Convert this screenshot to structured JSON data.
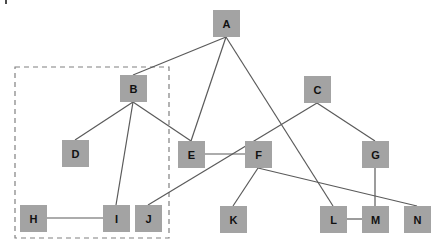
{
  "diagram": {
    "type": "graph",
    "colors": {
      "node_fill": "#a3a3a3",
      "node_text": "#111111",
      "edge": "#5a5a5a",
      "group_border": "#808080",
      "background": "#ffffff"
    },
    "nodes": [
      {
        "id": "A",
        "label": "A",
        "x": 213,
        "y": 10,
        "w": 27,
        "h": 27
      },
      {
        "id": "B",
        "label": "B",
        "x": 120,
        "y": 75,
        "w": 27,
        "h": 27
      },
      {
        "id": "C",
        "label": "C",
        "x": 304,
        "y": 76,
        "w": 27,
        "h": 27
      },
      {
        "id": "D",
        "label": "D",
        "x": 62,
        "y": 140,
        "w": 27,
        "h": 27
      },
      {
        "id": "E",
        "label": "E",
        "x": 178,
        "y": 141,
        "w": 27,
        "h": 27
      },
      {
        "id": "F",
        "label": "F",
        "x": 245,
        "y": 141,
        "w": 27,
        "h": 27
      },
      {
        "id": "G",
        "label": "G",
        "x": 362,
        "y": 141,
        "w": 27,
        "h": 27
      },
      {
        "id": "H",
        "label": "H",
        "x": 20,
        "y": 205,
        "w": 27,
        "h": 27
      },
      {
        "id": "I",
        "label": "I",
        "x": 103,
        "y": 205,
        "w": 27,
        "h": 27
      },
      {
        "id": "J",
        "label": "J",
        "x": 135,
        "y": 205,
        "w": 27,
        "h": 27
      },
      {
        "id": "K",
        "label": "K",
        "x": 220,
        "y": 206,
        "w": 27,
        "h": 27
      },
      {
        "id": "L",
        "label": "L",
        "x": 320,
        "y": 206,
        "w": 27,
        "h": 27
      },
      {
        "id": "M",
        "label": "M",
        "x": 362,
        "y": 206,
        "w": 27,
        "h": 27
      },
      {
        "id": "N",
        "label": "N",
        "x": 404,
        "y": 206,
        "w": 27,
        "h": 27
      }
    ],
    "edges": [
      {
        "from": "A",
        "to": "B",
        "x1": 226,
        "y1": 37,
        "x2": 133,
        "y2": 75
      },
      {
        "from": "A",
        "to": "E",
        "x1": 226,
        "y1": 37,
        "x2": 191,
        "y2": 141
      },
      {
        "from": "A",
        "to": "L",
        "x1": 226,
        "y1": 37,
        "x2": 333,
        "y2": 206
      },
      {
        "from": "B",
        "to": "D",
        "x1": 133,
        "y1": 102,
        "x2": 75,
        "y2": 140
      },
      {
        "from": "B",
        "to": "I",
        "x1": 133,
        "y1": 102,
        "x2": 116,
        "y2": 205
      },
      {
        "from": "B",
        "to": "E",
        "x1": 133,
        "y1": 102,
        "x2": 191,
        "y2": 141
      },
      {
        "from": "C",
        "to": "J",
        "x1": 317,
        "y1": 103,
        "x2": 148,
        "y2": 205
      },
      {
        "from": "C",
        "to": "G",
        "x1": 317,
        "y1": 103,
        "x2": 375,
        "y2": 141
      },
      {
        "from": "E",
        "to": "F",
        "x1": 205,
        "y1": 154,
        "x2": 245,
        "y2": 154
      },
      {
        "from": "F",
        "to": "K",
        "x1": 258,
        "y1": 168,
        "x2": 233,
        "y2": 206
      },
      {
        "from": "F",
        "to": "N",
        "x1": 258,
        "y1": 168,
        "x2": 417,
        "y2": 206
      },
      {
        "from": "G",
        "to": "M",
        "x1": 375,
        "y1": 168,
        "x2": 375,
        "y2": 206
      },
      {
        "from": "H",
        "to": "I",
        "x1": 47,
        "y1": 218,
        "x2": 103,
        "y2": 218
      },
      {
        "from": "L",
        "to": "M",
        "x1": 347,
        "y1": 219,
        "x2": 362,
        "y2": 219
      }
    ],
    "groups": [
      {
        "id": "group-B-D-H-I",
        "members": [
          "B",
          "D",
          "H",
          "I"
        ],
        "style": "dashed",
        "x": 15,
        "y": 67,
        "w": 154,
        "h": 171
      }
    ],
    "corner_mark": {
      "x": 6,
      "y1": 0,
      "y2": 4
    }
  }
}
